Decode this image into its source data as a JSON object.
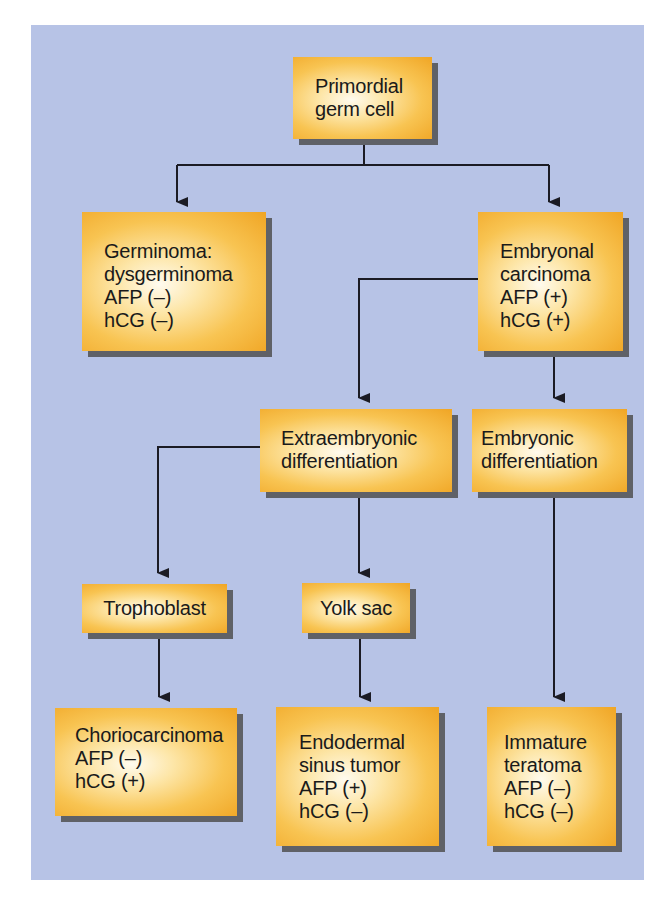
{
  "diagram": {
    "colors": {
      "background_panel": "#b7c3e6",
      "node_fill_edge": "#f0a524",
      "node_fill_center": "#fffbef",
      "node_shadow": "#5f6167",
      "connector": "#1b1b24"
    },
    "nodes": {
      "primordial": {
        "lines": [
          "Primordial",
          "germ cell"
        ]
      },
      "germinoma": {
        "lines": [
          "Germinoma:",
          "dysgerminoma",
          "AFP (–)",
          "hCG (–)"
        ]
      },
      "embryonal": {
        "lines": [
          "Embryonal",
          "carcinoma",
          "AFP (+)",
          "hCG (+)"
        ]
      },
      "extraembryonic": {
        "lines": [
          "Extraembryonic",
          "differentiation"
        ]
      },
      "embryonic": {
        "lines": [
          "Embryonic",
          "differentiation"
        ]
      },
      "trophoblast": {
        "lines": [
          "Trophoblast"
        ]
      },
      "yolk_sac": {
        "lines": [
          "Yolk sac"
        ]
      },
      "choriocarcinoma": {
        "lines": [
          "Choriocarcinoma",
          "AFP (–)",
          "hCG (+)"
        ]
      },
      "endodermal": {
        "lines": [
          "Endodermal",
          "sinus tumor",
          "AFP (+)",
          "hCG (–)"
        ]
      },
      "immature_teratoma": {
        "lines": [
          "Immature",
          "teratoma",
          "AFP (–)",
          "hCG (–)"
        ]
      }
    },
    "edges": [
      {
        "from": "primordial",
        "to": "germinoma"
      },
      {
        "from": "primordial",
        "to": "embryonal"
      },
      {
        "from": "embryonal",
        "to": "extraembryonic"
      },
      {
        "from": "embryonal",
        "to": "embryonic"
      },
      {
        "from": "extraembryonic",
        "to": "trophoblast"
      },
      {
        "from": "extraembryonic",
        "to": "yolk_sac"
      },
      {
        "from": "trophoblast",
        "to": "choriocarcinoma"
      },
      {
        "from": "yolk_sac",
        "to": "endodermal"
      },
      {
        "from": "embryonic",
        "to": "immature_teratoma"
      }
    ]
  }
}
